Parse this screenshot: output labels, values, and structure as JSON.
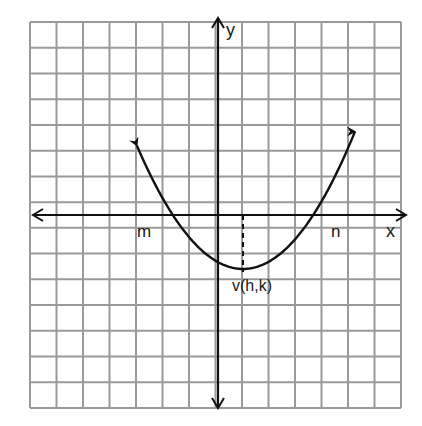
{
  "figure": {
    "type": "parabola-graph",
    "grid": {
      "columns": 14,
      "rows": 15,
      "color": "#9a9a9a",
      "left": 30,
      "top": 22,
      "right": 401,
      "bottom": 408
    },
    "axes": {
      "x_label": "x",
      "y_label": "y",
      "origin_px": [
        218,
        215
      ],
      "color": "#111111"
    },
    "curve": {
      "description": "upward-opening parabola with arrowheads",
      "left_end_px": [
        137,
        140
      ],
      "right_end_px": [
        355,
        138
      ],
      "vertex_px": [
        243,
        269
      ],
      "color": "#111111"
    },
    "labels": {
      "root_left": "m",
      "root_right": "n",
      "vertex": "v(h,k)"
    }
  }
}
